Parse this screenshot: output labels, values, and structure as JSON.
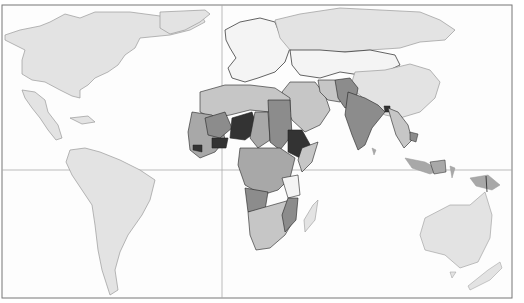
{
  "map": {
    "type": "choropleth",
    "projection": "world-equirectangular-like",
    "background": "#fdfdfd",
    "frame_color": "#777777",
    "gridlines": {
      "equator_color": "#aaaaaa",
      "prime_meridian_color": "#aaaaaa"
    },
    "shade_classes": [
      {
        "level": 0,
        "color": "#f4f4f4",
        "meaning": "no data / lowest"
      },
      {
        "level": 1,
        "color": "#e3e3e3",
        "meaning": "low"
      },
      {
        "level": 2,
        "color": "#c6c6c6",
        "meaning": "medium-low"
      },
      {
        "level": 3,
        "color": "#a8a8a8",
        "meaning": "medium"
      },
      {
        "level": 4,
        "color": "#8c8c8c",
        "meaning": "high"
      },
      {
        "level": 5,
        "color": "#333333",
        "meaning": "highest"
      }
    ],
    "regions": [
      {
        "name": "North America",
        "shade": 1
      },
      {
        "name": "Greenland",
        "shade": 1
      },
      {
        "name": "Central America",
        "shade": 1
      },
      {
        "name": "South America",
        "shade": 1
      },
      {
        "name": "Europe",
        "shade": 0
      },
      {
        "name": "Russia",
        "shade": 1
      },
      {
        "name": "China",
        "shade": 1
      },
      {
        "name": "Australia",
        "shade": 1
      },
      {
        "name": "North Africa",
        "shade": 2
      },
      {
        "name": "West Africa",
        "shade": 3
      },
      {
        "name": "Niger",
        "shade": 5
      },
      {
        "name": "Mali",
        "shade": 4
      },
      {
        "name": "Ethiopia",
        "shade": 5
      },
      {
        "name": "Sudan",
        "shade": 4
      },
      {
        "name": "Central Africa",
        "shade": 3
      },
      {
        "name": "Southern Africa",
        "shade": 2
      },
      {
        "name": "Tanzania",
        "shade": 0
      },
      {
        "name": "Madagascar",
        "shade": 1
      },
      {
        "name": "Arabian Peninsula",
        "shade": 2
      },
      {
        "name": "Afghanistan/Pakistan",
        "shade": 4
      },
      {
        "name": "India",
        "shade": 4
      },
      {
        "name": "Bangladesh",
        "shade": 5
      },
      {
        "name": "Southeast Asia",
        "shade": 2
      },
      {
        "name": "Indonesia",
        "shade": 3
      },
      {
        "name": "Papua New Guinea",
        "shade": 3
      }
    ]
  }
}
